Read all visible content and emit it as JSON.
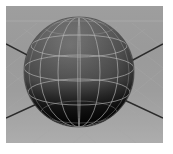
{
  "app": {
    "title": "3D Viewport",
    "background_color": "#ffffff"
  },
  "viewport": {
    "name": "perspective-viewport",
    "label": "Perspective",
    "background_color": "#9a9a9a",
    "border_color": "#ffffff",
    "bounds": {
      "x": 6,
      "y": 6,
      "width": 157,
      "height": 137
    }
  },
  "ground": {
    "name": "ground-grid",
    "label": "Ground Grid",
    "grid_color": "#b0b0b0",
    "plane_color": "#9d9d9d",
    "orientation": "diamond-perspective",
    "horizon_y": 18
  },
  "axes": {
    "name": "world-axes",
    "label": "World Axes",
    "color": "#2b2b2b",
    "lines": [
      {
        "name": "axis-upper-left",
        "x1": 0,
        "y1": 38,
        "x2": 46,
        "y2": 62
      },
      {
        "name": "axis-upper-right",
        "x1": 157,
        "y1": 38,
        "x2": 112,
        "y2": 62
      },
      {
        "name": "axis-lower-left",
        "x1": 0,
        "y1": 112,
        "x2": 44,
        "y2": 92
      },
      {
        "name": "axis-lower-right",
        "x1": 157,
        "y1": 112,
        "x2": 114,
        "y2": 92
      }
    ]
  },
  "sphere": {
    "name": "sphere-object",
    "label": "Sphere",
    "center_x": 79,
    "center_y": 72,
    "radius": 55,
    "shading": "smooth",
    "top_color": "#6e6e6e",
    "mid_color": "#565656",
    "bottom_color": "#0d0d0d",
    "wireframe_color": "#b9b9b9",
    "meridians": 8,
    "parallels": 5,
    "selected": false
  },
  "legend": {
    "object_name": "Sphere",
    "view_name": "Perspective"
  }
}
